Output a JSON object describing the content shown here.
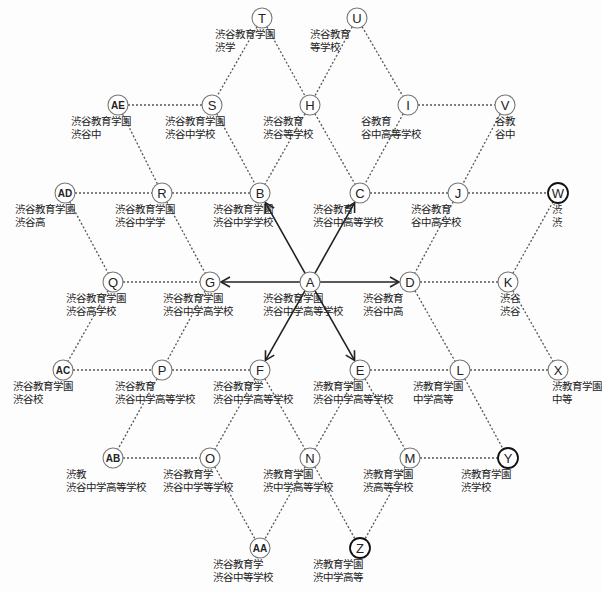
{
  "diagram": {
    "center_node": "A",
    "nodes": [
      {
        "id": "T",
        "x": 262,
        "y": 18,
        "line1": "渋谷教育学園",
        "line2": "渋学"
      },
      {
        "id": "U",
        "x": 357,
        "y": 18,
        "line1": "渋谷教育",
        "line2": "等学校"
      },
      {
        "id": "AE",
        "x": 118,
        "y": 105,
        "line1": "渋谷教育学園",
        "line2": "渋谷中"
      },
      {
        "id": "S",
        "x": 212,
        "y": 105,
        "line1": "渋谷教育学園",
        "line2": "渋谷中学校"
      },
      {
        "id": "H",
        "x": 310,
        "y": 105,
        "line1": "渋谷教育",
        "line2": "渋谷等学校"
      },
      {
        "id": "I",
        "x": 408,
        "y": 105,
        "line1": "谷教育",
        "line2": "谷中高等学校"
      },
      {
        "id": "V",
        "x": 505,
        "y": 105,
        "line1": "谷教",
        "line2": "谷中"
      },
      {
        "id": "AD",
        "x": 65,
        "y": 193,
        "line1": "渋谷教育学園",
        "line2": "渋谷高"
      },
      {
        "id": "R",
        "x": 162,
        "y": 193,
        "line1": "渋谷教育学園",
        "line2": "渋谷中学学"
      },
      {
        "id": "B",
        "x": 260,
        "y": 193,
        "line1": "渋谷教育学園",
        "line2": "渋谷中学学校"
      },
      {
        "id": "C",
        "x": 360,
        "y": 193,
        "line1": "渋谷教育",
        "line2": "渋谷中高等学校"
      },
      {
        "id": "J",
        "x": 458,
        "y": 193,
        "line1": "渋谷教育",
        "line2": "谷中高学校"
      },
      {
        "id": "W",
        "x": 558,
        "y": 193,
        "line1": "渋",
        "line2": "渋",
        "bold": true
      },
      {
        "id": "Q",
        "x": 113,
        "y": 282,
        "line1": "渋谷教育学園",
        "line2": "渋谷高学校"
      },
      {
        "id": "G",
        "x": 210,
        "y": 282,
        "line1": "渋谷教育学園",
        "line2": "渋谷中学高学校"
      },
      {
        "id": "A",
        "x": 310,
        "y": 282,
        "line1": "渋谷教育学園",
        "line2": "渋谷中学高等学校"
      },
      {
        "id": "D",
        "x": 410,
        "y": 282,
        "line1": "渋谷教育",
        "line2": "渋谷中高"
      },
      {
        "id": "K",
        "x": 508,
        "y": 282,
        "line1": "渋谷",
        "line2": "渋谷"
      },
      {
        "id": "AC",
        "x": 63,
        "y": 370,
        "line1": "渋谷教育学園",
        "line2": "渋谷校"
      },
      {
        "id": "P",
        "x": 162,
        "y": 370,
        "line1": "渋谷教育",
        "line2": "渋谷中学高等学校"
      },
      {
        "id": "F",
        "x": 260,
        "y": 370,
        "line1": "渋谷教育学",
        "line2": "渋谷中学高等学校"
      },
      {
        "id": "E",
        "x": 360,
        "y": 370,
        "line1": "渋教育学園",
        "line2": "渋谷中学高等学校"
      },
      {
        "id": "L",
        "x": 460,
        "y": 370,
        "line1": "渋教育学園",
        "line2": "中学高等"
      },
      {
        "id": "X",
        "x": 558,
        "y": 370,
        "line1": "渋教育学園",
        "line2": "中等"
      },
      {
        "id": "AB",
        "x": 113,
        "y": 458,
        "line1": "渋教",
        "line2": "渋谷中学高等学校"
      },
      {
        "id": "O",
        "x": 210,
        "y": 458,
        "line1": "渋谷教育学",
        "line2": "渋谷中学等学校"
      },
      {
        "id": "N",
        "x": 310,
        "y": 458,
        "line1": "渋教育学園",
        "line2": "渋中学高等学校"
      },
      {
        "id": "M",
        "x": 410,
        "y": 458,
        "line1": "渋教育学園",
        "line2": "渋高等学校"
      },
      {
        "id": "Y",
        "x": 508,
        "y": 458,
        "line1": "渋教育学園",
        "line2": "渋学校",
        "bold": true
      },
      {
        "id": "AA",
        "x": 260,
        "y": 548,
        "line1": "渋谷教育学",
        "line2": "渋谷中等学校"
      },
      {
        "id": "Z",
        "x": 360,
        "y": 548,
        "line1": "渋教育学園",
        "line2": "渋中学高等",
        "bold": true
      }
    ],
    "arrows_from_A": [
      "B",
      "C",
      "D",
      "E",
      "F",
      "G"
    ],
    "dotted_edges": [
      [
        "T",
        "S"
      ],
      [
        "T",
        "H"
      ],
      [
        "U",
        "H"
      ],
      [
        "U",
        "I"
      ],
      [
        "AE",
        "S"
      ],
      [
        "I",
        "V"
      ],
      [
        "AE",
        "R"
      ],
      [
        "S",
        "B"
      ],
      [
        "H",
        "B"
      ],
      [
        "H",
        "C"
      ],
      [
        "I",
        "C"
      ],
      [
        "V",
        "J"
      ],
      [
        "AD",
        "R"
      ],
      [
        "R",
        "B"
      ],
      [
        "C",
        "J"
      ],
      [
        "J",
        "W"
      ],
      [
        "AD",
        "Q"
      ],
      [
        "R",
        "G"
      ],
      [
        "J",
        "D"
      ],
      [
        "W",
        "K"
      ],
      [
        "Q",
        "G"
      ],
      [
        "D",
        "K"
      ],
      [
        "Q",
        "AC"
      ],
      [
        "G",
        "P"
      ],
      [
        "D",
        "L"
      ],
      [
        "K",
        "X"
      ],
      [
        "AC",
        "P"
      ],
      [
        "P",
        "F"
      ],
      [
        "E",
        "L"
      ],
      [
        "L",
        "X"
      ],
      [
        "P",
        "AB"
      ],
      [
        "F",
        "O"
      ],
      [
        "F",
        "N"
      ],
      [
        "E",
        "N"
      ],
      [
        "E",
        "M"
      ],
      [
        "L",
        "Y"
      ],
      [
        "AB",
        "O"
      ],
      [
        "M",
        "Y"
      ],
      [
        "O",
        "AA"
      ],
      [
        "N",
        "AA"
      ],
      [
        "N",
        "Z"
      ],
      [
        "M",
        "Z"
      ]
    ]
  }
}
